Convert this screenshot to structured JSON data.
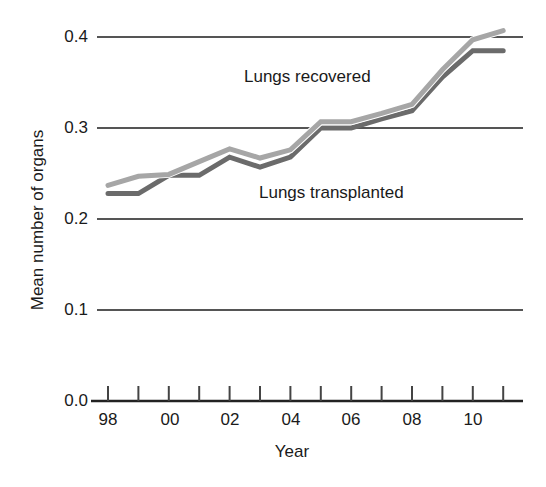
{
  "chart_data": {
    "type": "line",
    "title": "",
    "xlabel": "Year",
    "ylabel": "Mean number of organs",
    "ylim": [
      0.0,
      0.4
    ],
    "yticks": [
      "0.0",
      "0.1",
      "0.2",
      "0.3",
      "0.4"
    ],
    "x": [
      1998,
      1999,
      2000,
      2001,
      2002,
      2003,
      2004,
      2005,
      2006,
      2007,
      2008,
      2009,
      2010,
      2011
    ],
    "xtick_labels": [
      "98",
      "00",
      "02",
      "04",
      "06",
      "08",
      "10"
    ],
    "grid": "horizontal",
    "legend": "inline annotations",
    "series": [
      {
        "name": "Lungs recovered",
        "color": "#a6a6a6",
        "values": [
          0.237,
          0.247,
          0.249,
          0.263,
          0.277,
          0.267,
          0.276,
          0.307,
          0.307,
          0.316,
          0.326,
          0.364,
          0.397,
          0.407
        ]
      },
      {
        "name": "Lungs transplanted",
        "color": "#6b6b6b",
        "values": [
          0.228,
          0.228,
          0.248,
          0.248,
          0.268,
          0.257,
          0.268,
          0.3,
          0.3,
          0.31,
          0.319,
          0.356,
          0.385,
          0.385
        ]
      }
    ]
  },
  "labels": {
    "ylabel": "Mean number of organs",
    "xlabel": "Year",
    "annot_recovered": "Lungs recovered",
    "annot_transplanted": "Lungs transplanted",
    "yticks": [
      "0.4",
      "0.3",
      "0.2",
      "0.1",
      "0.0"
    ],
    "xticks": [
      "98",
      "00",
      "02",
      "04",
      "06",
      "08",
      "10"
    ]
  }
}
